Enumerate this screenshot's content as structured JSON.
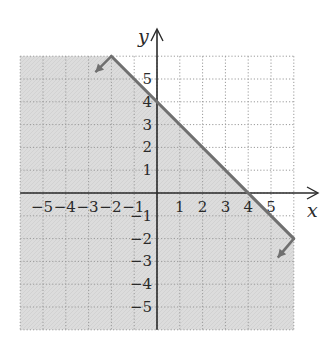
{
  "chart_data": {
    "type": "line",
    "title": "",
    "xlabel": "x",
    "ylabel": "y",
    "xlim": [
      -6,
      6
    ],
    "ylim": [
      -6,
      6
    ],
    "grid": true,
    "grid_style": "dotted",
    "x_tick_labels": [
      "−5",
      "−4",
      "−3",
      "−2",
      "−1",
      "1",
      "2",
      "3",
      "4",
      "5"
    ],
    "x_ticks": [
      -5,
      -4,
      -3,
      -2,
      -1,
      1,
      2,
      3,
      4,
      5
    ],
    "y_tick_labels": [
      "5",
      "4",
      "3",
      "2",
      "1",
      "−1",
      "−2",
      "−3",
      "−4",
      "−5"
    ],
    "y_ticks": [
      5,
      4,
      3,
      2,
      1,
      -1,
      -2,
      -3,
      -4,
      -5
    ],
    "series": [
      {
        "name": "boundary line y = -x + 4",
        "type": "line",
        "style": "solid",
        "x": [
          -2,
          6
        ],
        "y": [
          6,
          -2
        ],
        "arrows": "both ends",
        "intercepts": {
          "y_intercept": [
            0,
            4
          ],
          "x_intercept": [
            4,
            0
          ]
        }
      }
    ],
    "shaded_region": {
      "description": "half-plane below the line",
      "inequality": "y <= -x + 4",
      "color": "#d9d9d9"
    },
    "colors": {
      "line": "#707070",
      "axes": "#2a2a2a",
      "grid": "#9a9a9a",
      "shade": "#d9d9d9"
    }
  },
  "labels": {
    "x_axis": "x",
    "y_axis": "y"
  }
}
